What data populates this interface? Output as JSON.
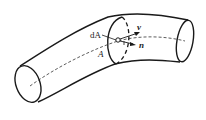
{
  "diagram": {
    "type": "flow tube with cross-section",
    "labels": {
      "area_element": "dA",
      "cross_section": "A",
      "velocity": "v",
      "normal": "n"
    },
    "colors": {
      "stroke": "#1a1a1a",
      "background": "#ffffff"
    }
  }
}
